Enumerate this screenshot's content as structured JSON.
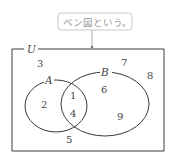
{
  "callout": {
    "text": "ベン図という。"
  },
  "universe": {
    "label": "U"
  },
  "sets": [
    {
      "name": "A",
      "label": "A"
    },
    {
      "name": "B",
      "label": "B"
    }
  ],
  "regions": {
    "outside": [
      "3",
      "7",
      "8",
      "5"
    ],
    "a_only": [
      "2"
    ],
    "intersection": [
      "1",
      "4"
    ],
    "b_only": [
      "6",
      "9"
    ]
  },
  "colors": {
    "outline": "#3a3a3a",
    "callout_border": "#c8c8c8",
    "callout_text": "#9a9a9a",
    "text": "#444444"
  }
}
